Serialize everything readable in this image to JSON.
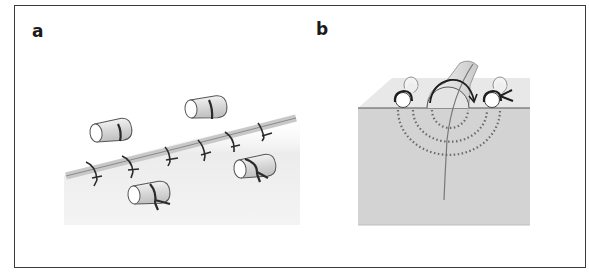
{
  "figure": {
    "panels": [
      {
        "id": "a",
        "label": "a",
        "description": "Surface view of a sutured wound with interrupted sutures along the incision and tie-over bolster rolls"
      },
      {
        "id": "b",
        "label": "b",
        "description": "Cross-section of skin showing bolster roll over wound with sutures passing deep (dotted arcs) and tied over bolsters"
      }
    ],
    "colors": {
      "border": "#3a3a3a",
      "skin_surface": "#e6e6e6",
      "skin_section": "#d2d2d2",
      "suture": "#2a2a2a",
      "bolster": "#dcdcdc",
      "dotted_path": "#6a6a6a"
    }
  }
}
